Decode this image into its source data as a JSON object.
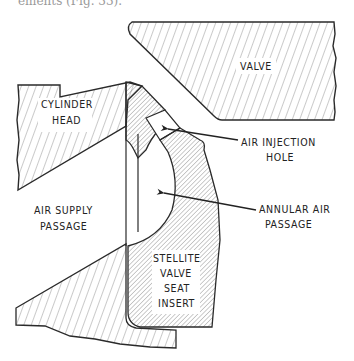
{
  "page": {
    "caption_fragment": "ements (Fig. 33)."
  },
  "diagram": {
    "type": "mechanical cross-section",
    "colors": {
      "line": "#2a2a2a",
      "hatch": "#555555",
      "background": "#ffffff"
    },
    "parts": {
      "valve": {
        "label": "VALVE"
      },
      "cylinder_head": {
        "label_line1": "CYLINDER",
        "label_line2": "HEAD"
      },
      "air_supply": {
        "label_line1": "AIR SUPPLY",
        "label_line2": "PASSAGE"
      },
      "seat_insert": {
        "label_line1": "STELLITE",
        "label_line2": "VALVE",
        "label_line3": "SEAT",
        "label_line4": "INSERT"
      }
    },
    "callouts": {
      "air_injection": {
        "label_line1": "AIR INJECTION",
        "label_line2": "HOLE"
      },
      "annular_passage": {
        "label_line1": "ANNULAR AIR",
        "label_line2": "PASSAGE"
      }
    }
  }
}
